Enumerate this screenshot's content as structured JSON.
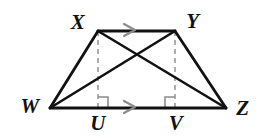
{
  "figure": {
    "background_color": "#ffffff",
    "stroke_color": "#111111",
    "dashed_color": "#9a9a9a",
    "tick_color": "#8c8c8c",
    "width": 260,
    "height": 140
  },
  "points": {
    "W": {
      "label": "W",
      "x": 50,
      "y": 108,
      "label_x": 30,
      "label_y": 106
    },
    "X": {
      "label": "X",
      "x": 98,
      "y": 31,
      "label_x": 78,
      "label_y": 22
    },
    "Y": {
      "label": "Y",
      "x": 175,
      "y": 31,
      "label_x": 193,
      "label_y": 21
    },
    "Z": {
      "label": "Z",
      "x": 226,
      "y": 108,
      "label_x": 243,
      "label_y": 108
    },
    "U": {
      "label": "U",
      "x": 98,
      "y": 108,
      "label_x": 98,
      "label_y": 123
    },
    "V": {
      "label": "V",
      "x": 175,
      "y": 108,
      "label_x": 176,
      "label_y": 123
    }
  },
  "segments": [
    {
      "name": "side-wx",
      "from": "W",
      "to": "X",
      "style": "solid"
    },
    {
      "name": "side-xy",
      "from": "X",
      "to": "Y",
      "style": "solid"
    },
    {
      "name": "side-yz",
      "from": "Y",
      "to": "Z",
      "style": "solid"
    },
    {
      "name": "side-wz",
      "from": "W",
      "to": "Z",
      "style": "solid"
    },
    {
      "name": "diagonal-xz",
      "from": "X",
      "to": "Z",
      "style": "solid"
    },
    {
      "name": "diagonal-wy",
      "from": "W",
      "to": "Y",
      "style": "solid"
    },
    {
      "name": "altitude-xu",
      "from": "X",
      "to": "U",
      "style": "dashed"
    },
    {
      "name": "altitude-yv",
      "from": "Y",
      "to": "V",
      "style": "dashed"
    }
  ],
  "parallel_ticks": [
    {
      "name": "tick-xy",
      "on": "side-xy",
      "x": 130,
      "y": 30,
      "direction": "right",
      "count": 1
    },
    {
      "name": "tick-wz",
      "on": "side-wz",
      "x": 130,
      "y": 107,
      "direction": "right",
      "count": 1
    }
  ],
  "right_angles": [
    {
      "name": "right-angle-u",
      "at": "U",
      "x": 98,
      "y": 108,
      "opens": "right",
      "size": 10
    },
    {
      "name": "right-angle-v",
      "at": "V",
      "x": 175,
      "y": 108,
      "opens": "left",
      "size": 10
    }
  ]
}
